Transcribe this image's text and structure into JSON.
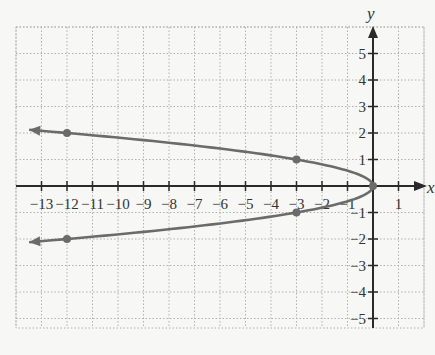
{
  "chart_data": {
    "type": "line",
    "title": "",
    "xlabel": "x",
    "ylabel": "y",
    "xlim": [
      -14,
      2
    ],
    "ylim": [
      -6,
      6
    ],
    "grid": true,
    "x_ticks": [
      -13,
      -12,
      -11,
      -10,
      -9,
      -8,
      -7,
      -6,
      -5,
      -4,
      -3,
      -2,
      -1,
      1
    ],
    "y_ticks": [
      -5,
      -4,
      -3,
      -2,
      -1,
      1,
      2,
      3,
      4,
      5
    ],
    "x_tick_labels": [
      "−13",
      "−12",
      "−11",
      "−10",
      "−9",
      "−8",
      "−7",
      "−6",
      "−5",
      "−4",
      "−3",
      "−2",
      "−1",
      "1"
    ],
    "y_tick_labels": [
      "−5",
      "−4",
      "−3",
      "−2",
      "−1",
      "1",
      "2",
      "3",
      "4",
      "5"
    ],
    "series": [
      {
        "name": "x = -3y^2",
        "equation": "x = -3y^2",
        "curve": "parabola opening left, vertex at origin, arrows on both ends",
        "points": [
          {
            "x": -12,
            "y": 2
          },
          {
            "x": -3,
            "y": 1
          },
          {
            "x": 0,
            "y": 0
          },
          {
            "x": -3,
            "y": -1
          },
          {
            "x": -12,
            "y": -2
          }
        ],
        "color": "#6b6b6b"
      }
    ]
  },
  "axes": {
    "x_label": "x",
    "y_label": "y"
  },
  "colors": {
    "curve": "#6b6b6b",
    "axis": "#2a2a2a",
    "grid": "#b0b0b0",
    "background": "#f7f7f5"
  }
}
